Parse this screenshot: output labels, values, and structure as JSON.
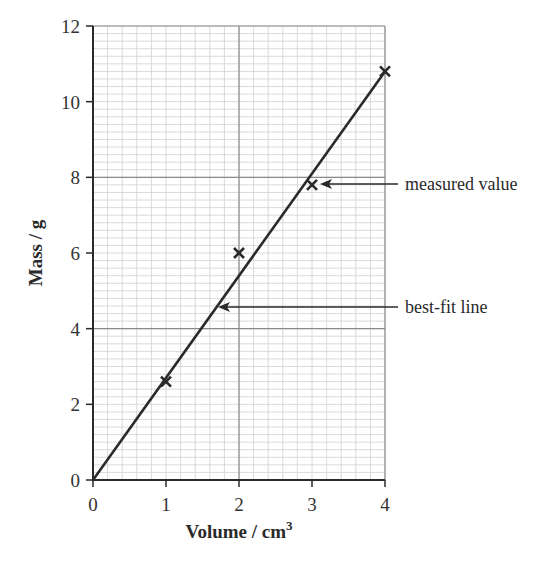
{
  "chart_data": {
    "type": "scatter",
    "title": "",
    "xlabel": "Volume / cm³",
    "xlabel_base": "Volume / cm",
    "xlabel_sup": "3",
    "ylabel": "Mass / g",
    "xlim": [
      0,
      4
    ],
    "ylim": [
      0,
      12
    ],
    "x_ticks": [
      0,
      1,
      2,
      3,
      4
    ],
    "y_ticks": [
      0,
      2,
      4,
      6,
      8,
      10,
      12
    ],
    "grid": true,
    "grid_minor_step_x": 0.2,
    "grid_minor_step_y": 0.2,
    "grid_major_x": [
      2,
      4
    ],
    "grid_major_y": [
      4,
      8,
      12
    ],
    "series": [
      {
        "name": "measured value",
        "marker": "x",
        "points": [
          {
            "x": 1,
            "y": 2.6
          },
          {
            "x": 2,
            "y": 6.0
          },
          {
            "x": 3,
            "y": 7.8
          },
          {
            "x": 4,
            "y": 10.8
          }
        ]
      },
      {
        "name": "best-fit line",
        "type": "line",
        "points": [
          {
            "x": 0,
            "y": 0
          },
          {
            "x": 4,
            "y": 10.8
          }
        ]
      }
    ],
    "annotations": [
      {
        "text": "measured value",
        "arrow_to": {
          "x": 3.05,
          "y": 7.8
        }
      },
      {
        "text": "best-fit line",
        "arrow_to": {
          "x": 1.75,
          "y": 4.5
        }
      }
    ],
    "legend": "none"
  },
  "labels": {
    "x_title": "Volume / cm",
    "x_title_sup": "3",
    "y_title": "Mass / g",
    "annot_measured": "measured value",
    "annot_bestfit": "best-fit line"
  },
  "colors": {
    "ink": "#2a2a2a",
    "grid_minor": "#d0d0d0",
    "grid_major": "#8a8a8a"
  }
}
